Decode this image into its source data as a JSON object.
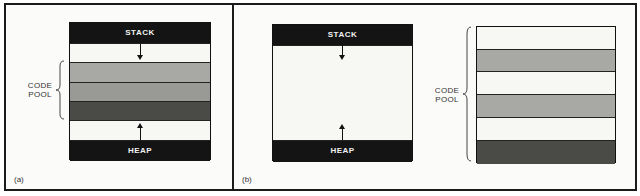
{
  "panels": [
    {
      "id": "a",
      "caption": "(a)",
      "box": {
        "top_label": "STACK",
        "bottom_label": "HEAP",
        "bands": [
          "stack",
          "free",
          "code",
          "code",
          "code-dark",
          "free",
          "heap"
        ]
      },
      "bracket_label": [
        "CODE",
        "POOL"
      ]
    },
    {
      "id": "b",
      "caption": "(b)",
      "box": {
        "top_label": "STACK",
        "bottom_label": "HEAP",
        "bands": [
          "stack",
          "free",
          "heap"
        ]
      },
      "separate_pool": {
        "bracket_label": [
          "CODE",
          "POOL"
        ],
        "bands": [
          "free",
          "code",
          "free",
          "code",
          "free",
          "code-dark"
        ]
      }
    }
  ],
  "colors": {
    "black": "#141414",
    "white": "#f7f7f4",
    "gray": "#a8a8a4",
    "dark": "#4a4a47"
  }
}
